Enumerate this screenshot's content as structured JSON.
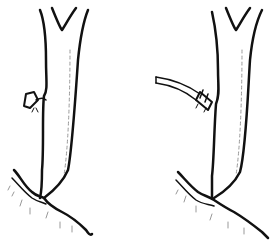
{
  "figure": {
    "panels": [
      {
        "id": "left",
        "description": "vessel with ligated side branch stump"
      },
      {
        "id": "right",
        "description": "vessel with side branch cannulated and tied"
      }
    ],
    "colors": {
      "stroke": "#111111",
      "shade": "#9a9a9a",
      "background": "#ffffff"
    }
  }
}
